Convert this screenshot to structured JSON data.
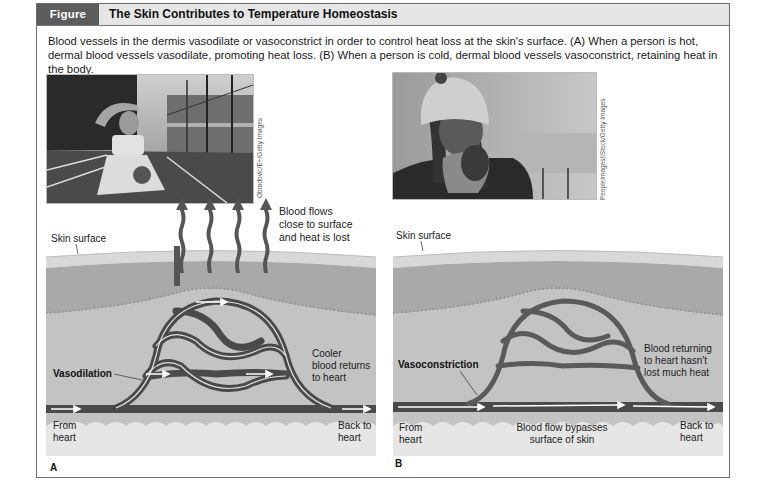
{
  "figure": {
    "number": "Figure 6.13",
    "title": "The Skin Contributes to Temperature Homeostasis",
    "caption": "Blood vessels in the dermis vasodilate or vasoconstrict in order to control heat loss at the skin's surface. (A) When a person is hot, dermal blood vessels vasodilate, promoting heat loss. (B) When a person is cold, dermal blood vessels vasoconstrict, retaining heat in the body."
  },
  "panel_a": {
    "letter": "A",
    "photo_description": "Athlete on a running track wiping forehead",
    "photo_credit": "Obradovic/E+/Getty Images",
    "labels": {
      "skin_surface": "Skin surface",
      "heat_loss": [
        "Blood flows",
        "close to surface",
        "and heat is lost"
      ],
      "vasodilation": "Vasodilation",
      "cooler_blood": [
        "Cooler",
        "blood returns",
        "to heart"
      ],
      "from_heart": [
        "From",
        "heart"
      ],
      "back_to_heart": [
        "Back to",
        "heart"
      ]
    }
  },
  "panel_b": {
    "letter": "B",
    "photo_description": "Woman in knit hat and scarf feeling cold",
    "photo_credit": "PeopleImages/iStock/Getty Images",
    "labels": {
      "skin_surface": "Skin surface",
      "vasoconstriction": "Vasoconstriction",
      "blood_returning": [
        "Blood returning",
        "to heart hasn't",
        "lost much heat"
      ],
      "from_heart": [
        "From",
        "heart"
      ],
      "bypass": [
        "Blood flow bypasses",
        "surface of skin"
      ],
      "back_to_heart": [
        "Back to",
        "heart"
      ]
    }
  },
  "colors": {
    "header_tag": "#5c5c5c",
    "header_bar": "#e6e6e6",
    "epidermis": "#d6d6d6",
    "dermis": "#a8a8a8",
    "hypodermis": "#c4c4c4",
    "vessel": "#4a4a4a",
    "fat": "#e8e8e8"
  }
}
